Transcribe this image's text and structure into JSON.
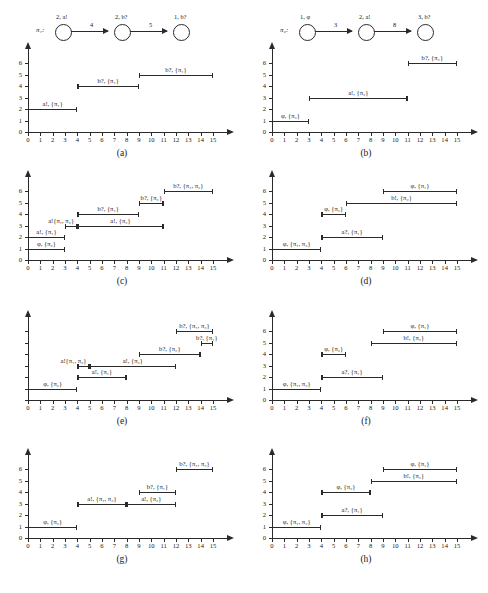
{
  "figure": {
    "panel_count": 8,
    "x_axis": {
      "min": 0,
      "max": 15,
      "ticks": [
        "0",
        "1",
        "2",
        "3",
        "4",
        "5",
        "6",
        "7",
        "8",
        "9",
        "10",
        "11",
        "12",
        "13",
        "14",
        "15"
      ]
    },
    "y_axis": {
      "min": 0,
      "max": 6,
      "ticks": [
        "0",
        "1",
        "2",
        "3",
        "4",
        "5",
        "6"
      ]
    }
  },
  "chart_data": [
    {
      "id": "a",
      "type": "bar",
      "caption": "(a)",
      "title": "",
      "xlabel": "",
      "ylabel": "",
      "xlim": [
        0,
        15
      ],
      "ylim": [
        0,
        6
      ],
      "grid": false,
      "y_tick_labels_shown": true,
      "automaton": {
        "name": "π₁:",
        "nodes": [
          {
            "label": "2, a!"
          },
          {
            "label": "2, b?"
          },
          {
            "label": "1, b?"
          }
        ],
        "edges": [
          {
            "label": "4"
          },
          {
            "label": "5"
          }
        ]
      },
      "segments": [
        {
          "label": "a!, {π₁}",
          "y": 2,
          "start": 0,
          "end": 4
        },
        {
          "label": "b?, {π₁}",
          "y": 4,
          "start": 4,
          "end": 9
        },
        {
          "label": "b?, {π₁}",
          "y": 5,
          "start": 9,
          "end": 15
        }
      ]
    },
    {
      "id": "b",
      "type": "bar",
      "caption": "(b)",
      "title": "",
      "xlabel": "",
      "ylabel": "",
      "xlim": [
        0,
        15
      ],
      "ylim": [
        0,
        6
      ],
      "grid": false,
      "y_tick_labels_shown": true,
      "automaton": {
        "name": "π₂:",
        "nodes": [
          {
            "label": "1, φ"
          },
          {
            "label": "2, a!"
          },
          {
            "label": "3, b?"
          }
        ],
        "edges": [
          {
            "label": "3"
          },
          {
            "label": "8"
          }
        ]
      },
      "segments": [
        {
          "label": "φ, {π₂}",
          "y": 1,
          "start": 0,
          "end": 3
        },
        {
          "label": "a!, {π₂}",
          "y": 3,
          "start": 3,
          "end": 11
        },
        {
          "label": "b?, {π₂}",
          "y": 6,
          "start": 11,
          "end": 15
        }
      ]
    },
    {
      "id": "c",
      "type": "bar",
      "caption": "(c)",
      "title": "",
      "xlabel": "",
      "ylabel": "",
      "xlim": [
        0,
        15
      ],
      "ylim": [
        0,
        6
      ],
      "grid": false,
      "y_tick_labels_shown": true,
      "automaton": null,
      "segments": [
        {
          "label": "φ, {π₂}",
          "y": 1,
          "start": 0,
          "end": 3
        },
        {
          "label": "a!, {π₁}",
          "y": 2,
          "start": 0,
          "end": 3
        },
        {
          "label": "a!{π₁, π₂}",
          "y": 3,
          "start": 3,
          "end": 4,
          "label_offset": -10
        },
        {
          "label": "a!, {π₂}",
          "y": 3,
          "start": 4,
          "end": 11
        },
        {
          "label": "b?, {π₁}",
          "y": 4,
          "start": 4,
          "end": 9
        },
        {
          "label": "b?, {π₂}",
          "y": 5,
          "start": 9,
          "end": 11
        },
        {
          "label": "b?, {π₁, π₂}",
          "y": 6,
          "start": 11,
          "end": 15
        }
      ]
    },
    {
      "id": "d",
      "type": "bar",
      "caption": "(d)",
      "title": "",
      "xlabel": "",
      "ylabel": "",
      "xlim": [
        0,
        15
      ],
      "ylim": [
        0,
        6
      ],
      "grid": false,
      "y_tick_labels_shown": true,
      "automaton": null,
      "segments": [
        {
          "label": "φ, {π₁, π₂}",
          "y": 1,
          "start": 0,
          "end": 4
        },
        {
          "label": "a?, {π₁}",
          "y": 2,
          "start": 4,
          "end": 9
        },
        {
          "label": "φ, {π₂}",
          "y": 4,
          "start": 4,
          "end": 6
        },
        {
          "label": "b!, {π₂}",
          "y": 5,
          "start": 6,
          "end": 15
        },
        {
          "label": "φ, {π₁}",
          "y": 6,
          "start": 9,
          "end": 15
        }
      ]
    },
    {
      "id": "e",
      "type": "bar",
      "caption": "(e)",
      "title": "",
      "xlabel": "",
      "ylabel": "",
      "xlim": [
        0,
        15
      ],
      "ylim": [
        0,
        6
      ],
      "grid": false,
      "y_tick_labels_shown": false,
      "automaton": null,
      "segments": [
        {
          "label": "φ, {π₂}",
          "y": 1,
          "start": 0,
          "end": 4
        },
        {
          "label": "a!, {π₁}",
          "y": 2,
          "start": 4,
          "end": 8
        },
        {
          "label": "a!{π₁, π₂}",
          "y": 3,
          "start": 4,
          "end": 5,
          "label_offset": -10
        },
        {
          "label": "a!, {π₂}",
          "y": 3,
          "start": 5,
          "end": 12
        },
        {
          "label": "b?, {π₂}",
          "y": 4,
          "start": 9,
          "end": 14
        },
        {
          "label": "b?, {π₁}",
          "y": 5,
          "start": 14,
          "end": 15
        },
        {
          "label": "b?, {π₁, π₂}",
          "y": 6,
          "start": 12,
          "end": 15
        }
      ]
    },
    {
      "id": "f",
      "type": "bar",
      "caption": "(f)",
      "title": "",
      "xlabel": "",
      "ylabel": "",
      "xlim": [
        0,
        15
      ],
      "ylim": [
        0,
        6
      ],
      "grid": false,
      "y_tick_labels_shown": true,
      "automaton": null,
      "segments": [
        {
          "label": "φ, {π₁, π₂}",
          "y": 1,
          "start": 0,
          "end": 4
        },
        {
          "label": "a?, {π₁}",
          "y": 2,
          "start": 4,
          "end": 9
        },
        {
          "label": "φ, {π₂}",
          "y": 4,
          "start": 4,
          "end": 6
        },
        {
          "label": "b!, {π₂}",
          "y": 5,
          "start": 8,
          "end": 15
        },
        {
          "label": "φ, {π₁}",
          "y": 6,
          "start": 9,
          "end": 15
        }
      ]
    },
    {
      "id": "g",
      "type": "bar",
      "caption": "(g)",
      "title": "",
      "xlabel": "",
      "ylabel": "",
      "xlim": [
        0,
        15
      ],
      "ylim": [
        0,
        6
      ],
      "grid": false,
      "y_tick_labels_shown": true,
      "automaton": null,
      "segments": [
        {
          "label": "φ, {π₂}",
          "y": 1,
          "start": 0,
          "end": 4
        },
        {
          "label": "a!, {π₁, π₂}",
          "y": 3,
          "start": 4,
          "end": 8
        },
        {
          "label": "a!, {π₂}",
          "y": 3,
          "start": 8,
          "end": 12
        },
        {
          "label": "b?, {π₁}",
          "y": 4,
          "start": 9,
          "end": 12
        },
        {
          "label": "b?, {π₁, π₂}",
          "y": 6,
          "start": 12,
          "end": 15
        }
      ]
    },
    {
      "id": "h",
      "type": "bar",
      "caption": "(h)",
      "title": "",
      "xlabel": "",
      "ylabel": "",
      "xlim": [
        0,
        15
      ],
      "ylim": [
        0,
        6
      ],
      "grid": false,
      "y_tick_labels_shown": true,
      "automaton": null,
      "segments": [
        {
          "label": "φ, {π₁, π₂}",
          "y": 1,
          "start": 0,
          "end": 4
        },
        {
          "label": "a?, {π₁}",
          "y": 2,
          "start": 4,
          "end": 9
        },
        {
          "label": "φ, {π₂}",
          "y": 4,
          "start": 4,
          "end": 8
        },
        {
          "label": "b!, {π₂}",
          "y": 5,
          "start": 8,
          "end": 15
        },
        {
          "label": "φ, {π₁}",
          "y": 6,
          "start": 9,
          "end": 15
        }
      ]
    }
  ]
}
